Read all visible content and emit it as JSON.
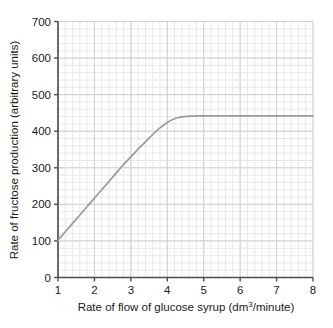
{
  "chart_data": {
    "type": "line",
    "title": "",
    "xlabel": "Rate of flow of glucose syrup (dm³/minute)",
    "xlabel_main": "Rate of flow of glucose syrup (dm",
    "xlabel_sup": "3",
    "xlabel_tail": "/minute)",
    "ylabel": "Rate of fructose production (arbitrary units)",
    "xlim": [
      1,
      8
    ],
    "ylim": [
      0,
      700
    ],
    "xticks": [
      "1",
      "2",
      "3",
      "4",
      "5",
      "6",
      "7",
      "8"
    ],
    "xtick_values": [
      1,
      2,
      3,
      4,
      5,
      6,
      7,
      8
    ],
    "yticks": [
      "0",
      "100",
      "200",
      "300",
      "400",
      "500",
      "600",
      "700"
    ],
    "ytick_values": [
      0,
      100,
      200,
      300,
      400,
      500,
      600,
      700
    ],
    "grid": true,
    "grid_minor_step_x": 0.2,
    "grid_minor_step_y": 20,
    "grid_major_step_x": 1,
    "grid_major_step_y": 100,
    "legend": null,
    "series": [
      {
        "name": "Rate of fructose production",
        "color": "#9a9a9a",
        "x": [
          1.0,
          1.2,
          1.4,
          1.6,
          1.8,
          2.0,
          2.2,
          2.4,
          2.6,
          2.8,
          3.0,
          3.2,
          3.4,
          3.6,
          3.8,
          4.0,
          4.2,
          4.4,
          4.6,
          4.8,
          5.0,
          5.5,
          6.0,
          6.5,
          7.0,
          7.5,
          8.0
        ],
        "values": [
          102,
          125,
          148,
          171,
          194,
          217,
          240,
          263,
          286,
          309,
          330,
          351,
          371,
          391,
          409,
          424,
          434,
          439,
          441,
          442,
          442,
          442,
          442,
          442,
          442,
          442,
          442
        ]
      }
    ],
    "plateau_value": 442,
    "start_value": 102,
    "saturation_x": 4.6
  },
  "colors": {
    "axis": "#4d4d4d",
    "curve": "#9a9a9a",
    "grid_minor": "#e8e8ec",
    "grid_major": "#cfcfd6",
    "text": "#1a1a1a",
    "background": "#ffffff"
  }
}
